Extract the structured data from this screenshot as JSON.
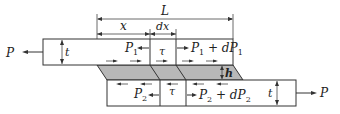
{
  "diagram": {
    "colors": {
      "stroke": "#333333",
      "adhesive_fill": "#b8b8b8",
      "background": "#ffffff"
    },
    "dimensions": {
      "overlap_length": "L",
      "position": "x",
      "element_width": "dx",
      "adherend_thickness_top": "t",
      "adherend_thickness_bottom": "t",
      "adhesive_thickness": "h"
    },
    "loads": {
      "applied_left": "P",
      "applied_right": "P",
      "top_left_force": "P",
      "top_left_sub": "1",
      "top_right_force": "P",
      "top_right_sub": "1",
      "top_right_plus": " + dP",
      "top_right_sub2": "1",
      "bottom_left_force": "P",
      "bottom_left_sub": "2",
      "bottom_right_force": "P",
      "bottom_right_sub": "2",
      "bottom_right_plus": " + dP",
      "bottom_right_sub2": "2",
      "shear_top": "τ",
      "shear_bottom": "τ"
    }
  }
}
